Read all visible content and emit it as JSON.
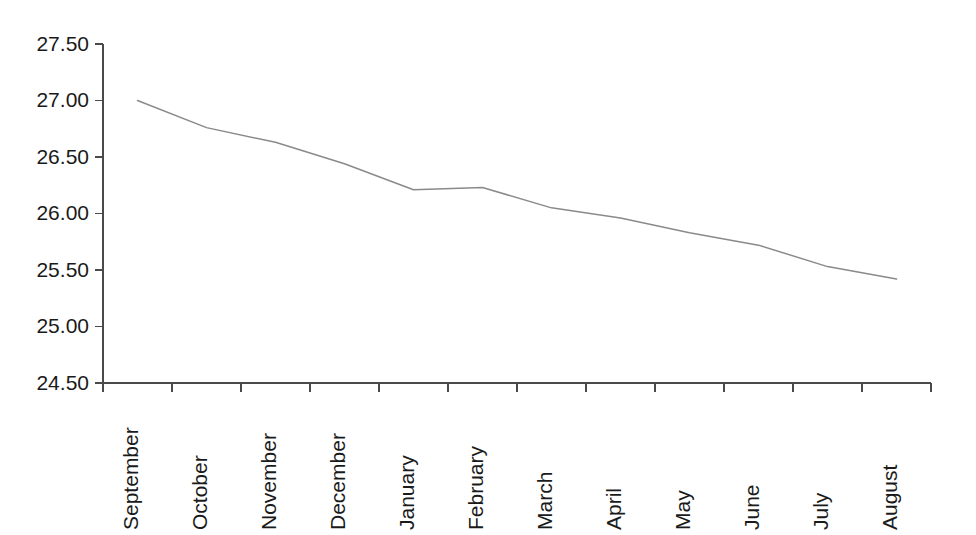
{
  "chart_data": {
    "type": "line",
    "title": "",
    "subtitle": "",
    "xlabel": "",
    "ylabel": "",
    "categories": [
      "September",
      "October",
      "November",
      "December",
      "January",
      "February",
      "March",
      "April",
      "May",
      "June",
      "July",
      "August"
    ],
    "values": [
      27.0,
      26.76,
      26.63,
      26.44,
      26.21,
      26.23,
      26.05,
      25.96,
      25.83,
      25.72,
      25.53,
      25.42
    ],
    "series": [
      {
        "name": "",
        "values": [
          27.0,
          26.76,
          26.63,
          26.44,
          26.21,
          26.23,
          26.05,
          25.96,
          25.83,
          25.72,
          25.53,
          25.42
        ]
      }
    ],
    "ylim": [
      24.5,
      27.5
    ],
    "ytick_labels": [
      "27.50",
      "27.00",
      "26.50",
      "26.00",
      "25.50",
      "25.00",
      "24.50"
    ],
    "ytick_values": [
      27.5,
      27.0,
      26.5,
      26.0,
      25.5,
      25.0,
      24.5
    ],
    "grid": false,
    "legend": null,
    "legend_position": "none",
    "line_color": "#8a8a8a",
    "axis_color": "#4a4a4a",
    "text_color": "#1a1a1a",
    "background_color": "#ffffff",
    "xtick_rotation": -90,
    "annotations": []
  },
  "layout": {
    "plot_left": 103,
    "plot_right": 931,
    "plot_top": 44,
    "plot_bottom": 383,
    "x_label_top": 410
  }
}
